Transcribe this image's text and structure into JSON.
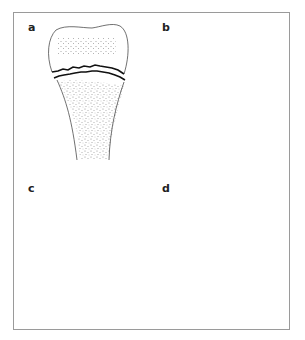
{
  "figure": {
    "panels": [
      {
        "id": "a",
        "label": "a",
        "description": "Fracture through the physis (transverse, Type I)"
      },
      {
        "id": "b",
        "label": "b",
        "description": "Fracture through physis extending into metaphysis (Type II)"
      },
      {
        "id": "c",
        "label": "c",
        "description": "Fracture through physis extending into epiphysis (Type III)"
      },
      {
        "id": "d",
        "label": "d",
        "description": "Vertical fracture through epiphysis, physis and metaphysis (Type IV)"
      }
    ],
    "colors": {
      "frame": "#9a9a9a",
      "outline": "#333333",
      "fracture": "#111111",
      "stipple": "#8a8a8a"
    }
  }
}
